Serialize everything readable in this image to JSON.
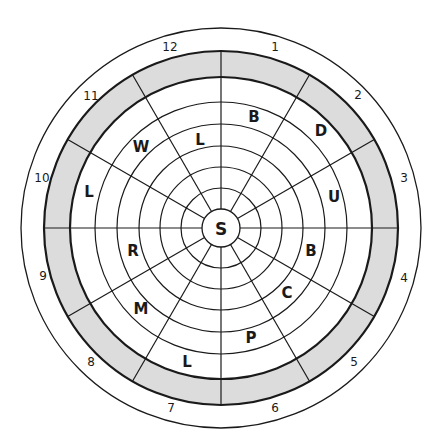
{
  "diagram": {
    "type": "circular-sector-wheel",
    "center": {
      "x": 221,
      "y": 228
    },
    "colors": {
      "line": "#1a1a1a",
      "band_fill": "#dcdcdc",
      "background": "#ffffff"
    },
    "rings": {
      "center_radius": 19,
      "inner_ring_radii": [
        40,
        61,
        82,
        104,
        126
      ],
      "band_inner_radius": 151,
      "band_outer_radius": 177,
      "outer_radius": 200
    },
    "spoke_count": 12,
    "center_label": "S",
    "sector_letters": [
      {
        "text": "B",
        "x": 254,
        "y": 117
      },
      {
        "text": "D",
        "x": 321,
        "y": 131
      },
      {
        "text": "U",
        "x": 334,
        "y": 197
      },
      {
        "text": "B",
        "x": 311,
        "y": 251
      },
      {
        "text": "C",
        "x": 287,
        "y": 293
      },
      {
        "text": "P",
        "x": 251,
        "y": 338
      },
      {
        "text": "L",
        "x": 187,
        "y": 362
      },
      {
        "text": "M",
        "x": 141,
        "y": 309
      },
      {
        "text": "R",
        "x": 133,
        "y": 251
      },
      {
        "text": "L",
        "x": 89,
        "y": 192
      },
      {
        "text": "W",
        "x": 141,
        "y": 147
      },
      {
        "text": "L",
        "x": 200,
        "y": 140
      }
    ],
    "sector_numbers": [
      {
        "text": "12",
        "x": 170,
        "y": 47
      },
      {
        "text": "1",
        "x": 275,
        "y": 47
      },
      {
        "text": "2",
        "x": 358,
        "y": 95
      },
      {
        "text": "3",
        "x": 404,
        "y": 178
      },
      {
        "text": "4",
        "x": 404,
        "y": 278
      },
      {
        "text": "5",
        "x": 354,
        "y": 362
      },
      {
        "text": "6",
        "x": 275,
        "y": 408
      },
      {
        "text": "7",
        "x": 171,
        "y": 408
      },
      {
        "text": "8",
        "x": 91,
        "y": 362
      },
      {
        "text": "9",
        "x": 43,
        "y": 276
      },
      {
        "text": "10",
        "x": 42,
        "y": 178
      },
      {
        "text": "11",
        "x": 91,
        "y": 96
      }
    ]
  }
}
